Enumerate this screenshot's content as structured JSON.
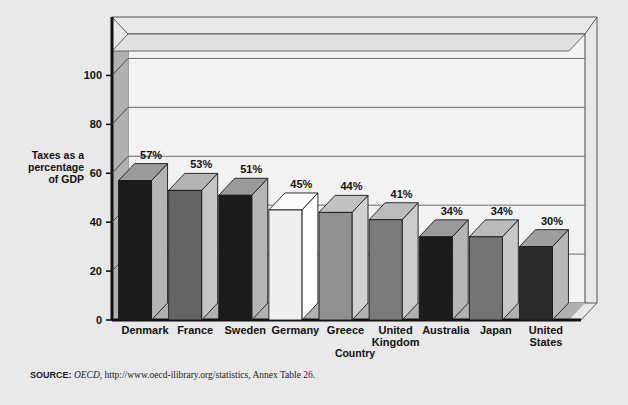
{
  "figure": {
    "background_color": "#e9e9e9",
    "plot_background_color": "#f2f2f2",
    "wall_color": "#b0b0b0",
    "floor_color": "#b0b0b0",
    "frame_color": "#1a1a1a",
    "gridline_color": "#6b6b6b"
  },
  "chart_data": {
    "type": "bar",
    "title": "",
    "xlabel": "Country",
    "ylabel": "Taxes as a percentage of GDP",
    "ylabel_lines": [
      "Taxes as a",
      "percentage",
      "of GDP"
    ],
    "categories": [
      "Denmark",
      "France",
      "Sweden",
      "Germany",
      "Greece",
      "United Kingdom",
      "Australia",
      "Japan",
      "United States"
    ],
    "category_lines": [
      [
        "Denmark"
      ],
      [
        "France"
      ],
      [
        "Sweden"
      ],
      [
        "Germany"
      ],
      [
        "Greece"
      ],
      [
        "United",
        "Kingdom"
      ],
      [
        "Australia"
      ],
      [
        "Japan"
      ],
      [
        "United",
        "States"
      ]
    ],
    "values": [
      57,
      53,
      51,
      45,
      44,
      41,
      34,
      34,
      30
    ],
    "value_labels": [
      "57%",
      "53%",
      "51%",
      "45%",
      "44%",
      "41%",
      "34%",
      "34%",
      "30%"
    ],
    "bar_colors": [
      "#1c1c1c",
      "#656565",
      "#1c1c1c",
      "#f0f0f0",
      "#8f8f8f",
      "#7a7a7a",
      "#1c1c1c",
      "#747474",
      "#2a2a2a"
    ],
    "bar_top_colors": [
      "#9a9a9a",
      "#b4b4b4",
      "#9a9a9a",
      "#fbfbfb",
      "#c2c2c2",
      "#bcbcbc",
      "#9a9a9a",
      "#bababa",
      "#9e9e9e"
    ],
    "bar_side_colors": [
      "#b5b5b5",
      "#c6c6c6",
      "#b5b5b5",
      "#ffffff",
      "#d0d0d0",
      "#cbcbcb",
      "#b5b5b5",
      "#c8c8c8",
      "#b8b8b8"
    ],
    "ylim": [
      0,
      110
    ],
    "yticks": [
      0,
      20,
      40,
      60,
      80,
      100
    ],
    "ytick_labels": [
      "0",
      "20",
      "40",
      "60",
      "80",
      "100"
    ],
    "grid": true,
    "grid_axis": "y",
    "legend": null,
    "three_d": true
  },
  "source": {
    "label": "SOURCE:",
    "publisher": "OECD",
    "rest": ", http://www.oecd-ilibrary.org/statistics, Annex Table 26."
  }
}
